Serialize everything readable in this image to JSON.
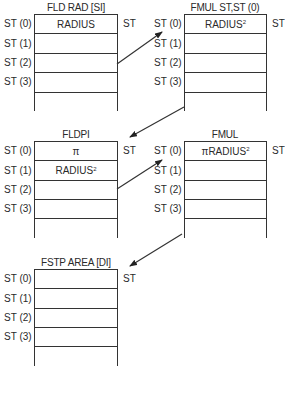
{
  "diagram": {
    "register_labels": [
      "ST (0)",
      "ST (1)",
      "ST (2)",
      "ST (3)"
    ],
    "top_pointer_label": "ST",
    "stacks": [
      {
        "title": "FLD RAD [SI]",
        "rows": [
          {
            "text": "RADIUS",
            "sup": ""
          },
          {
            "text": "",
            "sup": ""
          },
          {
            "text": "",
            "sup": ""
          },
          {
            "text": "",
            "sup": ""
          }
        ]
      },
      {
        "title": "FMUL ST,ST (0)",
        "rows": [
          {
            "text": "RADIUS",
            "sup": "2"
          },
          {
            "text": "",
            "sup": ""
          },
          {
            "text": "",
            "sup": ""
          },
          {
            "text": "",
            "sup": ""
          }
        ]
      },
      {
        "title": "FLDPI",
        "rows": [
          {
            "text": "π",
            "sup": ""
          },
          {
            "text": "RADIUS",
            "sup": "2"
          },
          {
            "text": "",
            "sup": ""
          },
          {
            "text": "",
            "sup": ""
          }
        ]
      },
      {
        "title": "FMUL",
        "rows": [
          {
            "text": "πRADIUS",
            "sup": "2"
          },
          {
            "text": "",
            "sup": ""
          },
          {
            "text": "",
            "sup": ""
          },
          {
            "text": "",
            "sup": ""
          }
        ]
      },
      {
        "title": "FSTP AREA [DI]",
        "rows": [
          {
            "text": "",
            "sup": ""
          },
          {
            "text": "",
            "sup": ""
          },
          {
            "text": "",
            "sup": ""
          },
          {
            "text": "",
            "sup": ""
          }
        ]
      }
    ],
    "arrows": [
      {
        "from": "FLD RAD [SI]",
        "to": "FMUL ST,ST (0)"
      },
      {
        "from": "FMUL ST,ST (0)",
        "to": "FLDPI"
      },
      {
        "from": "FLDPI",
        "to": "FMUL"
      },
      {
        "from": "FMUL",
        "to": "FSTP AREA [DI]"
      }
    ]
  }
}
